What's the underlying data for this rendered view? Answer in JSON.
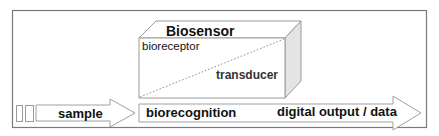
{
  "diagram": {
    "title": "Biosensor",
    "cube_labels": {
      "top": "bioreceptor",
      "bottom": "transducer"
    },
    "flow": {
      "input": "sample",
      "process": "biorecognition",
      "output": "digital output / data"
    },
    "colors": {
      "stroke": "#8a8a8a",
      "frame": "#777777",
      "side_face": "#e2e2e2",
      "text": "#111111"
    }
  }
}
